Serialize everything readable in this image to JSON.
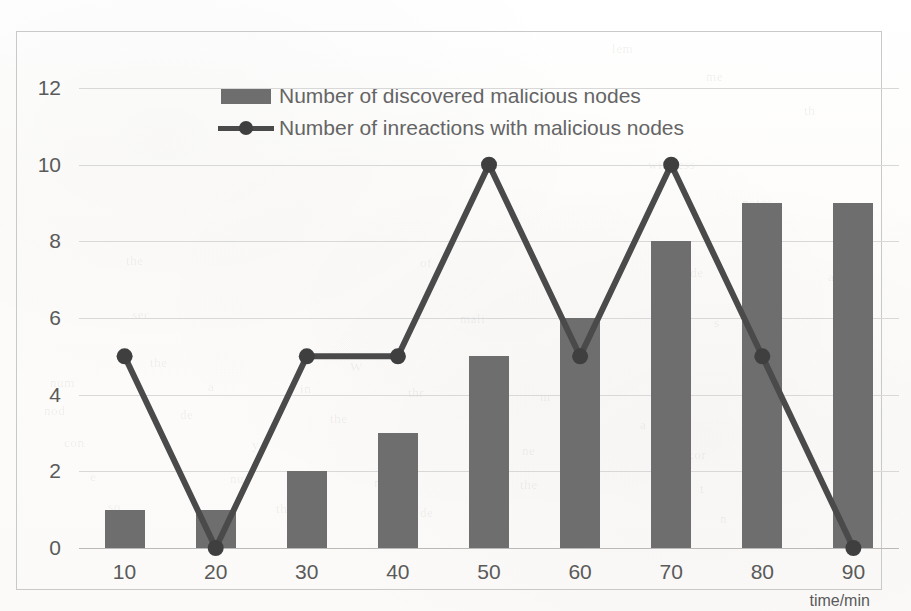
{
  "chart_data": {
    "type": "bar",
    "title": "",
    "xlabel": "time/min",
    "ylabel": "",
    "categories": [
      "10",
      "20",
      "30",
      "40",
      "50",
      "60",
      "70",
      "80",
      "90"
    ],
    "x_values": [
      10,
      20,
      30,
      40,
      50,
      60,
      70,
      80,
      90
    ],
    "y_ticks": [
      "0",
      "2",
      "4",
      "6",
      "8",
      "10",
      "12"
    ],
    "y_tick_values": [
      0,
      2,
      4,
      6,
      8,
      10,
      12
    ],
    "ylim": [
      0,
      12
    ],
    "grid": "horizontal",
    "legend_position": "top-center",
    "series": [
      {
        "name": "Number of discovered malicious nodes",
        "type": "bar",
        "color": "#6e6e6e",
        "values": [
          1,
          1,
          2,
          3,
          5,
          6,
          8,
          9,
          9
        ]
      },
      {
        "name": "Number of inreactions with malicious nodes",
        "type": "line",
        "color": "#4a4a4a",
        "marker": "circle",
        "values": [
          5,
          0,
          5,
          5,
          10,
          5,
          10,
          5,
          0
        ]
      }
    ]
  },
  "legend": {
    "items": [
      {
        "label": "Number of discovered malicious nodes",
        "marker": "bar-swatch"
      },
      {
        "label": "Number of inreactions with malicious nodes",
        "marker": "line-marker-swatch"
      }
    ]
  },
  "axes": {
    "x_axis_title": "time/min",
    "x_tick_labels": [
      "10",
      "20",
      "30",
      "40",
      "50",
      "60",
      "70",
      "80",
      "90"
    ],
    "y_tick_labels": [
      "12",
      "10",
      "8",
      "6",
      "4",
      "2",
      "0"
    ]
  },
  "colors": {
    "bar_fill": "#6e6e6e",
    "line_stroke": "#4a4a4a",
    "marker_fill": "#3f3f3f",
    "gridline": "#d8d8d8",
    "axis_line": "#b9b9b9",
    "frame_border": "#c9c9c9",
    "tick_text": "#5a5a5a",
    "legend_text": "#656565",
    "background": "#ffffff"
  },
  "background_ghost_text": [
    {
      "text": "lem",
      "x": 612,
      "y": 34
    },
    {
      "text": "me",
      "x": 706,
      "y": 62
    },
    {
      "text": "th",
      "x": 804,
      "y": 96
    },
    {
      "text": "wireless",
      "x": 648,
      "y": 150
    },
    {
      "text": "notes",
      "x": 742,
      "y": 188
    },
    {
      "text": "mo",
      "x": 836,
      "y": 228
    },
    {
      "text": "the",
      "x": 126,
      "y": 246
    },
    {
      "text": "of",
      "x": 420,
      "y": 248
    },
    {
      "text": "node",
      "x": 676,
      "y": 258
    },
    {
      "text": "and",
      "x": 828,
      "y": 262
    },
    {
      "text": "sec",
      "x": 132,
      "y": 300
    },
    {
      "text": "mali",
      "x": 460,
      "y": 304
    },
    {
      "text": "s",
      "x": 714,
      "y": 308
    },
    {
      "text": "the",
      "x": 150,
      "y": 348
    },
    {
      "text": "W",
      "x": 350,
      "y": 352
    },
    {
      "text": "a",
      "x": 560,
      "y": 352
    },
    {
      "text": "num",
      "x": 50,
      "y": 368
    },
    {
      "text": "a",
      "x": 208,
      "y": 372
    },
    {
      "text": "in",
      "x": 300,
      "y": 374
    },
    {
      "text": "thr",
      "x": 408,
      "y": 378
    },
    {
      "text": "m",
      "x": 540,
      "y": 382
    },
    {
      "text": "nod",
      "x": 44,
      "y": 396
    },
    {
      "text": "de",
      "x": 180,
      "y": 400
    },
    {
      "text": "the",
      "x": 330,
      "y": 404
    },
    {
      "text": "to",
      "x": 470,
      "y": 408
    },
    {
      "text": "a",
      "x": 640,
      "y": 410
    },
    {
      "text": "con",
      "x": 64,
      "y": 428
    },
    {
      "text": "y",
      "x": 252,
      "y": 430
    },
    {
      "text": "th",
      "x": 388,
      "y": 432
    },
    {
      "text": "ne",
      "x": 522,
      "y": 436
    },
    {
      "text": "cor",
      "x": 688,
      "y": 440
    },
    {
      "text": "e",
      "x": 90,
      "y": 462
    },
    {
      "text": "nu",
      "x": 230,
      "y": 464
    },
    {
      "text": "mal",
      "x": 374,
      "y": 468
    },
    {
      "text": "the",
      "x": 520,
      "y": 470
    },
    {
      "text": "t",
      "x": 700,
      "y": 474
    },
    {
      "text": "so",
      "x": 108,
      "y": 492
    },
    {
      "text": "th",
      "x": 276,
      "y": 494
    },
    {
      "text": "de",
      "x": 420,
      "y": 498
    },
    {
      "text": "a",
      "x": 576,
      "y": 500
    },
    {
      "text": "n",
      "x": 720,
      "y": 504
    },
    {
      "text": "inf",
      "x": 846,
      "y": 508
    }
  ]
}
